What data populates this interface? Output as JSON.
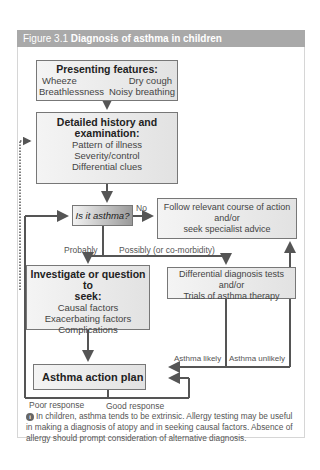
{
  "figure": {
    "number": "Figure 3.1",
    "title": "Diagnosis of asthma in children"
  },
  "nodes": {
    "presenting": {
      "heading": "Presenting features:",
      "items": [
        "Wheeze",
        "Dry cough",
        "Breathlessness",
        "Noisy breathing"
      ]
    },
    "history": {
      "heading_line1": "Detailed history and",
      "heading_line2": "examination:",
      "items": [
        "Pattern of illness",
        "Severity/control",
        "Differential clues"
      ]
    },
    "decision": {
      "label": "Is it asthma?"
    },
    "follow": {
      "lines": [
        "Follow relevant course of action",
        "and/or",
        "seek specialist advice"
      ]
    },
    "investigate": {
      "heading_line1": "Investigate or question to",
      "heading_line2": "seek:",
      "items": [
        "Causal factors",
        "Exacerbating factors",
        "Complications"
      ]
    },
    "differential": {
      "lines": [
        "Differential diagnosis tests",
        "and/or",
        "Trials of asthma therapy"
      ]
    },
    "action_plan": {
      "label": "Asthma action plan"
    }
  },
  "edge_labels": {
    "no": "No",
    "probably": "Probably",
    "possibly": "Possibly (or co-morbidity)",
    "asthma_likely": "Asthma likely",
    "asthma_unlikely": "Asthma unlikely",
    "poor_response": "Poor response",
    "good_response": "Good response"
  },
  "footnote": {
    "icon": "info-icon",
    "text": "In children, asthma tends to be extrinsic. Allergy testing may be useful in making a diagnosis of atopy and in seeking causal factors. Absence of allergy should prompt consideration of alternative diagnosis."
  },
  "colors": {
    "header_bg": "#a9a9a9",
    "line": "#555555",
    "box_border": "#777777"
  }
}
